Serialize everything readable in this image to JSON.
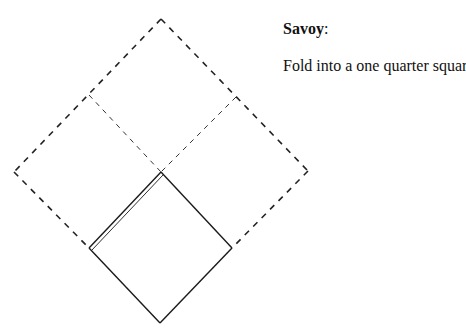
{
  "caption": {
    "title": "Savoy",
    "title_suffix": ":",
    "instruction": "Fold into a one quarter square"
  },
  "diagram": {
    "colors": {
      "stroke": "#222222",
      "crease": "#333333"
    },
    "outer_square": {
      "top": [
        161,
        19
      ],
      "left": [
        14,
        172
      ],
      "right": [
        308,
        171
      ],
      "bottom_center": [
        161,
        172
      ],
      "style": "dashed"
    },
    "creases": [
      {
        "from": [
          89,
          95
        ],
        "to": [
          161,
          172
        ],
        "style": "dashed-light"
      },
      {
        "from": [
          236,
          97
        ],
        "to": [
          161,
          172
        ],
        "style": "dashed-light"
      }
    ],
    "folded_square": {
      "top": [
        161,
        172
      ],
      "left": [
        89,
        248
      ],
      "right": [
        232,
        248
      ],
      "bottom": [
        160,
        323
      ],
      "style": "solid",
      "double_edge": "upper-left"
    }
  }
}
